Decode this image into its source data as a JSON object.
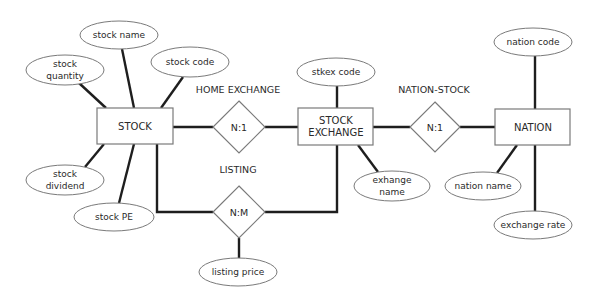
{
  "diagram": {
    "type": "entity-relationship",
    "colors": {
      "line": "#1e1e1e",
      "shape_stroke": "#7a7a7a",
      "text": "#2a2a2a",
      "background": "#ffffff"
    },
    "entities": {
      "stock": {
        "label": "STOCK"
      },
      "stock_exchange": {
        "label_line1": "STOCK",
        "label_line2": "EXCHANGE"
      },
      "nation": {
        "label": "NATION"
      }
    },
    "relationships": {
      "home_exchange": {
        "name": "HOME EXCHANGE",
        "cardinality": "N:1"
      },
      "listing": {
        "name": "LISTING",
        "cardinality": "N:M"
      },
      "nation_stock": {
        "name": "NATION-STOCK",
        "cardinality": "N:1"
      }
    },
    "attributes": {
      "stock_name": {
        "label": "stock name"
      },
      "stock_quantity": {
        "line1": "stock",
        "line2": "quantity"
      },
      "stock_code": {
        "label": "stock code"
      },
      "stock_dividend": {
        "line1": "stock",
        "line2": "dividend"
      },
      "stock_pe": {
        "label": "stock PE"
      },
      "listing_price": {
        "label": "listing price"
      },
      "stkex_code": {
        "label": "stkex code"
      },
      "exchange_name": {
        "line1": "exhange",
        "line2": "name"
      },
      "nation_code": {
        "label": "nation code"
      },
      "nation_name": {
        "label": "nation name"
      },
      "exchange_rate": {
        "label": "exchange rate"
      }
    }
  }
}
